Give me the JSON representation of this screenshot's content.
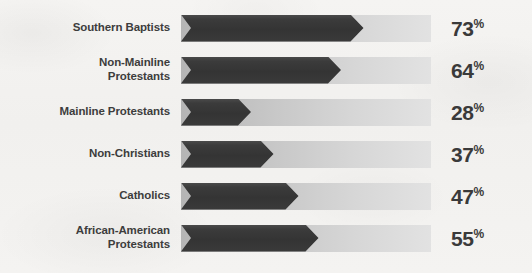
{
  "chart_data": {
    "type": "bar",
    "orientation": "horizontal",
    "title": "",
    "subtitle": "",
    "xlabel": "",
    "ylabel": "",
    "xlim": [
      0,
      100
    ],
    "grid": false,
    "legend": null,
    "value_suffix": "%",
    "categories": [
      "Southern Baptists",
      "Non-Mainline\nProtestants",
      "Mainline Protestants",
      "Non-Christians",
      "Catholics",
      "African-American\nProtestants"
    ],
    "values": [
      73,
      64,
      28,
      37,
      47,
      55
    ],
    "value_labels": [
      "73",
      "64",
      "28",
      "37",
      "47",
      "55"
    ],
    "bars": [
      {
        "label": "Southern Baptists",
        "value": 73,
        "value_label": "73",
        "suffix": "%"
      },
      {
        "label": "Non-Mainline\nProtestants",
        "value": 64,
        "value_label": "64",
        "suffix": "%"
      },
      {
        "label": "Mainline Protestants",
        "value": 28,
        "value_label": "28",
        "suffix": "%"
      },
      {
        "label": "Non-Christians",
        "value": 37,
        "value_label": "37",
        "suffix": "%"
      },
      {
        "label": "Catholics",
        "value": 47,
        "value_label": "47",
        "suffix": "%"
      },
      {
        "label": "African-American\nProtestants",
        "value": 55,
        "value_label": "55",
        "suffix": "%"
      }
    ],
    "colors": {
      "bar_fill_dark": "#343434",
      "bar_fill_light": "#4a4a4a",
      "track_start": "#b5b5b5",
      "track_end": "#e2e2e2",
      "label_text": "#3d3d3d",
      "value_text": "#3a3a3a",
      "background": "#f3f2f0"
    }
  }
}
